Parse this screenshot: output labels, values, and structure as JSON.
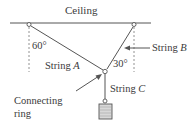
{
  "diagram": {
    "ceiling_label": "Ceiling",
    "angle_a": "60°",
    "angle_b": "30°",
    "string_a": {
      "prefix": "String ",
      "letter": "A"
    },
    "string_b": {
      "prefix": "String ",
      "letter": "B"
    },
    "string_c": {
      "prefix": "String ",
      "letter": "C"
    },
    "ring_label_line1": "Connecting",
    "ring_label_line2": "ring",
    "colors": {
      "line": "#555555",
      "text": "#3a3a3a",
      "weight_fill": "#d8d8d8"
    }
  }
}
